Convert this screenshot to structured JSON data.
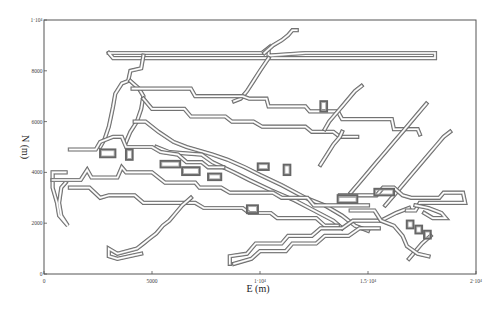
{
  "chart_data": {
    "type": "line",
    "title": "",
    "xlabel": "E (m)",
    "ylabel": "N (m)",
    "xlim": [
      0,
      20000
    ],
    "ylim": [
      0,
      10000
    ],
    "grid": false,
    "legend": null,
    "x_ticks": [
      {
        "value": 0,
        "label": "0"
      },
      {
        "value": 5000,
        "label": "5000"
      },
      {
        "value": 10000,
        "label": "1·10⁴"
      },
      {
        "value": 15000,
        "label": "1.5·10⁴"
      },
      {
        "value": 20000,
        "label": "2·10⁴"
      }
    ],
    "y_ticks": [
      {
        "value": 0,
        "label": "0"
      },
      {
        "value": 2000,
        "label": "2000"
      },
      {
        "value": 4000,
        "label": "4000"
      },
      {
        "value": 6000,
        "label": "6000"
      },
      {
        "value": 8000,
        "label": "8000"
      },
      {
        "value": 10000,
        "label": "1·10⁴"
      }
    ],
    "series": [
      {
        "name": "trace-top-horizontal",
        "points": [
          [
            3000,
            8700
          ],
          [
            10100,
            8700
          ],
          [
            10400,
            8900
          ],
          [
            10400,
            8600
          ],
          [
            12100,
            8700
          ],
          [
            18100,
            8700
          ],
          [
            18100,
            8500
          ],
          [
            3200,
            8500
          ],
          [
            3000,
            8700
          ]
        ]
      },
      {
        "name": "trace-top-step-ne",
        "points": [
          [
            10200,
            8700
          ],
          [
            10600,
            9000
          ],
          [
            11000,
            9200
          ],
          [
            11300,
            9400
          ],
          [
            11500,
            9600
          ],
          [
            11700,
            9600
          ]
        ]
      },
      {
        "name": "trace-upper-diagonal-sw",
        "points": [
          [
            10400,
            8500
          ],
          [
            10000,
            8000
          ],
          [
            9700,
            7600
          ],
          [
            9400,
            7200
          ],
          [
            9100,
            6900
          ],
          [
            8800,
            6800
          ]
        ]
      },
      {
        "name": "trace-west-upper",
        "points": [
          [
            4600,
            8600
          ],
          [
            4500,
            8100
          ],
          [
            4000,
            8000
          ],
          [
            3900,
            7600
          ],
          [
            3600,
            7500
          ],
          [
            3300,
            7100
          ],
          [
            3200,
            6600
          ],
          [
            3100,
            6200
          ],
          [
            3000,
            5800
          ],
          [
            2800,
            5300
          ],
          [
            2600,
            5000
          ]
        ]
      },
      {
        "name": "trace-west-upper-2",
        "points": [
          [
            4000,
            7600
          ],
          [
            4400,
            7300
          ],
          [
            4600,
            7000
          ],
          [
            4500,
            6500
          ],
          [
            4300,
            6000
          ],
          [
            4000,
            5600
          ],
          [
            3800,
            5200
          ]
        ]
      },
      {
        "name": "trace-upper-east-1",
        "points": [
          [
            4100,
            7300
          ],
          [
            6800,
            7300
          ],
          [
            7000,
            7000
          ],
          [
            9200,
            7000
          ],
          [
            9500,
            6900
          ],
          [
            10300,
            6900
          ],
          [
            10400,
            6600
          ],
          [
            12100,
            6600
          ],
          [
            12300,
            6400
          ],
          [
            13600,
            6400
          ],
          [
            13800,
            6100
          ],
          [
            16100,
            6100
          ],
          [
            16200,
            5700
          ],
          [
            17300,
            5700
          ],
          [
            17400,
            5500
          ]
        ]
      },
      {
        "name": "trace-upper-east-2",
        "points": [
          [
            4600,
            6900
          ],
          [
            5000,
            6500
          ],
          [
            6500,
            6500
          ],
          [
            6800,
            6200
          ],
          [
            8400,
            6200
          ],
          [
            8700,
            6000
          ],
          [
            9700,
            6000
          ],
          [
            10100,
            5800
          ],
          [
            12100,
            5800
          ],
          [
            12400,
            5600
          ],
          [
            13400,
            5600
          ],
          [
            13700,
            5400
          ],
          [
            14500,
            5400
          ]
        ]
      },
      {
        "name": "trace-middle-diagonal",
        "points": [
          [
            4200,
            6000
          ],
          [
            4700,
            6000
          ],
          [
            5300,
            5600
          ],
          [
            6000,
            5200
          ],
          [
            6600,
            5000
          ],
          [
            7800,
            4700
          ],
          [
            8500,
            4500
          ],
          [
            9300,
            4200
          ],
          [
            10000,
            3900
          ],
          [
            11000,
            3500
          ],
          [
            12100,
            3000
          ],
          [
            13000,
            2700
          ],
          [
            13800,
            2300
          ],
          [
            14400,
            1900
          ],
          [
            15000,
            1700
          ]
        ]
      },
      {
        "name": "trace-middle-diagonal-2",
        "points": [
          [
            5200,
            5000
          ],
          [
            5800,
            4800
          ],
          [
            7300,
            4700
          ],
          [
            7800,
            4400
          ],
          [
            8800,
            4000
          ],
          [
            9500,
            3700
          ],
          [
            10500,
            3300
          ],
          [
            11600,
            2900
          ],
          [
            12500,
            2500
          ],
          [
            13400,
            2100
          ],
          [
            13800,
            1800
          ]
        ]
      },
      {
        "name": "trace-west-branch",
        "points": [
          [
            1200,
            4900
          ],
          [
            2400,
            4900
          ],
          [
            2600,
            5200
          ],
          [
            3200,
            5400
          ],
          [
            3600,
            5400
          ],
          [
            3800,
            5000
          ],
          [
            5000,
            5000
          ],
          [
            5400,
            4800
          ],
          [
            6200,
            4700
          ],
          [
            6600,
            4400
          ],
          [
            7300,
            4400
          ],
          [
            7600,
            4200
          ],
          [
            8300,
            4200
          ]
        ]
      },
      {
        "name": "trace-west-hook",
        "points": [
          [
            1000,
            4000
          ],
          [
            400,
            4000
          ],
          [
            400,
            3400
          ],
          [
            600,
            2800
          ],
          [
            700,
            2300
          ],
          [
            1100,
            1900
          ],
          [
            800,
            2300
          ],
          [
            700,
            2800
          ],
          [
            800,
            3400
          ],
          [
            1000,
            3600
          ]
        ]
      },
      {
        "name": "trace-west-lower",
        "points": [
          [
            400,
            3700
          ],
          [
            1700,
            3700
          ],
          [
            2000,
            4100
          ],
          [
            2200,
            3800
          ],
          [
            3400,
            3800
          ],
          [
            3600,
            4200
          ],
          [
            3800,
            4000
          ],
          [
            5000,
            4000
          ],
          [
            5600,
            3600
          ],
          [
            7000,
            3600
          ],
          [
            7200,
            3400
          ],
          [
            8200,
            3400
          ],
          [
            8600,
            3200
          ],
          [
            10600,
            3200
          ],
          [
            11000,
            3000
          ],
          [
            12200,
            3000
          ],
          [
            12500,
            2700
          ],
          [
            15000,
            2700
          ]
        ]
      },
      {
        "name": "trace-west-lower-2",
        "points": [
          [
            1200,
            3400
          ],
          [
            2100,
            3400
          ],
          [
            2600,
            3000
          ],
          [
            3000,
            3100
          ],
          [
            4200,
            3100
          ],
          [
            4600,
            2800
          ],
          [
            7000,
            2800
          ],
          [
            7400,
            2600
          ],
          [
            9200,
            2600
          ],
          [
            9500,
            2400
          ],
          [
            10500,
            2400
          ],
          [
            10800,
            2200
          ],
          [
            12600,
            2200
          ],
          [
            13000,
            1900
          ],
          [
            13600,
            1900
          ]
        ]
      },
      {
        "name": "trace-sw-staircase",
        "points": [
          [
            6800,
            3000
          ],
          [
            6400,
            2700
          ],
          [
            6100,
            2400
          ],
          [
            5800,
            2100
          ],
          [
            5500,
            1900
          ],
          [
            5200,
            1600
          ],
          [
            4900,
            1400
          ],
          [
            4600,
            1200
          ],
          [
            4300,
            1000
          ],
          [
            3400,
            800
          ],
          [
            3000,
            1000
          ],
          [
            3000,
            700
          ],
          [
            3400,
            600
          ],
          [
            4500,
            800
          ]
        ]
      },
      {
        "name": "trace-south",
        "points": [
          [
            8600,
            400
          ],
          [
            8600,
            700
          ],
          [
            9400,
            800
          ],
          [
            9800,
            1200
          ],
          [
            11000,
            1200
          ],
          [
            11300,
            1500
          ],
          [
            12400,
            1500
          ],
          [
            12800,
            1800
          ],
          [
            13800,
            1800
          ],
          [
            14300,
            2100
          ],
          [
            15600,
            2100
          ],
          [
            16300,
            2400
          ],
          [
            16900,
            2600
          ]
        ]
      },
      {
        "name": "trace-south-2",
        "points": [
          [
            8800,
            400
          ],
          [
            9600,
            600
          ],
          [
            10000,
            900
          ],
          [
            11200,
            900
          ],
          [
            11500,
            1200
          ],
          [
            12600,
            1200
          ],
          [
            13000,
            1500
          ],
          [
            14100,
            1500
          ],
          [
            14600,
            1800
          ],
          [
            15500,
            1800
          ]
        ]
      },
      {
        "name": "trace-east-upper-stair-1",
        "points": [
          [
            13000,
            5700
          ],
          [
            13200,
            6000
          ],
          [
            13500,
            6300
          ],
          [
            13800,
            6600
          ],
          [
            14100,
            6900
          ],
          [
            14400,
            7200
          ],
          [
            14700,
            7400
          ]
        ]
      },
      {
        "name": "trace-east-upper-stair-2",
        "points": [
          [
            12800,
            4300
          ],
          [
            13100,
            4700
          ],
          [
            13400,
            5100
          ],
          [
            13700,
            5400
          ],
          [
            13800,
            5600
          ]
        ]
      },
      {
        "name": "trace-east-stair-3",
        "points": [
          [
            14200,
            3200
          ],
          [
            14600,
            3600
          ],
          [
            15000,
            4000
          ],
          [
            15400,
            4400
          ],
          [
            15800,
            4800
          ],
          [
            16200,
            5200
          ],
          [
            16600,
            5600
          ],
          [
            17000,
            6000
          ],
          [
            17400,
            6400
          ],
          [
            17700,
            6700
          ]
        ]
      },
      {
        "name": "trace-east-stair-4",
        "points": [
          [
            15800,
            2700
          ],
          [
            16200,
            3100
          ],
          [
            16600,
            3500
          ],
          [
            17000,
            3900
          ],
          [
            17400,
            4300
          ],
          [
            17800,
            4700
          ],
          [
            18200,
            5100
          ],
          [
            18500,
            5400
          ],
          [
            18800,
            5600
          ]
        ]
      },
      {
        "name": "trace-east-lower-stair",
        "points": [
          [
            16900,
            600
          ],
          [
            17200,
            900
          ],
          [
            17500,
            1200
          ],
          [
            17900,
            1500
          ]
        ]
      },
      {
        "name": "trace-east-horizontal",
        "points": [
          [
            13700,
            3100
          ],
          [
            15400,
            3100
          ],
          [
            15700,
            3400
          ],
          [
            16200,
            3400
          ],
          [
            16600,
            3100
          ],
          [
            17000,
            3000
          ],
          [
            18300,
            3000
          ],
          [
            18500,
            3200
          ],
          [
            19400,
            3200
          ],
          [
            19500,
            2800
          ],
          [
            17400,
            2800
          ],
          [
            17200,
            2500
          ],
          [
            16800,
            2500
          ]
        ]
      },
      {
        "name": "trace-east-horizontal-2",
        "points": [
          [
            14200,
            2500
          ],
          [
            15300,
            2500
          ],
          [
            15600,
            2100
          ],
          [
            16200,
            1900
          ],
          [
            16600,
            1500
          ],
          [
            16800,
            1100
          ],
          [
            17300,
            800
          ],
          [
            17800,
            700
          ]
        ]
      },
      {
        "name": "trace-east-small-loop",
        "points": [
          [
            17200,
            2700
          ],
          [
            17800,
            2600
          ],
          [
            18400,
            2400
          ],
          [
            18600,
            2200
          ],
          [
            18000,
            2200
          ],
          [
            17600,
            2400
          ]
        ]
      }
    ],
    "small_features": [
      {
        "name": "blob-1",
        "x": 2600,
        "y": 4600,
        "w": 700,
        "h": 300
      },
      {
        "name": "blob-2",
        "x": 3800,
        "y": 4500,
        "w": 300,
        "h": 400
      },
      {
        "name": "blob-3",
        "x": 5400,
        "y": 4200,
        "w": 900,
        "h": 250
      },
      {
        "name": "blob-4",
        "x": 6400,
        "y": 3900,
        "w": 800,
        "h": 300
      },
      {
        "name": "blob-5",
        "x": 7600,
        "y": 3700,
        "w": 600,
        "h": 250
      },
      {
        "name": "blob-6",
        "x": 9900,
        "y": 4100,
        "w": 500,
        "h": 250
      },
      {
        "name": "blob-7",
        "x": 11100,
        "y": 3900,
        "w": 300,
        "h": 400
      },
      {
        "name": "blob-8",
        "x": 13600,
        "y": 2800,
        "w": 900,
        "h": 300
      },
      {
        "name": "blob-9",
        "x": 15300,
        "y": 3100,
        "w": 900,
        "h": 250
      },
      {
        "name": "blob-10",
        "x": 12800,
        "y": 6400,
        "w": 300,
        "h": 400
      },
      {
        "name": "blob-11",
        "x": 16800,
        "y": 1800,
        "w": 300,
        "h": 300
      },
      {
        "name": "blob-12",
        "x": 17200,
        "y": 1600,
        "w": 300,
        "h": 300
      },
      {
        "name": "blob-13",
        "x": 17600,
        "y": 1400,
        "w": 300,
        "h": 300
      },
      {
        "name": "blob-14",
        "x": 9400,
        "y": 2400,
        "w": 500,
        "h": 300
      }
    ]
  },
  "axes": {
    "x_title": "E (m)",
    "y_title": "N (m)"
  },
  "layout": {
    "plot_left": 44,
    "plot_right": 476,
    "plot_top": 20,
    "plot_bottom": 274
  }
}
